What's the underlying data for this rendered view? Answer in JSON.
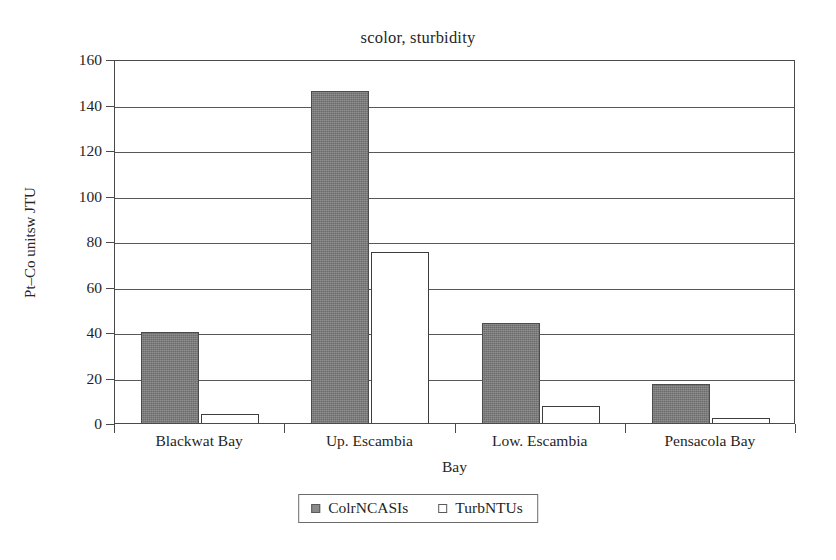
{
  "chart_data": {
    "type": "bar",
    "title": "scolor, sturbidity",
    "xlabel": "Bay",
    "ylabel": "Pt–Co unitsw JTU",
    "categories": [
      "Blackwat Bay",
      "Up. Escambia",
      "Low. Escambia",
      "Pensacola Bay"
    ],
    "series": [
      {
        "name": "ColrNCASIs",
        "values": [
          40,
          146,
          44,
          17
        ],
        "color": "#797979",
        "swatch": "filled-gray-square"
      },
      {
        "name": "TurbNTUs",
        "values": [
          4,
          75,
          7.5,
          2
        ],
        "color": "#ffffff",
        "swatch": "empty-white-square"
      }
    ],
    "ylim": [
      0,
      160
    ],
    "ytick_step": 20,
    "yticks": [
      "160",
      "140",
      "120",
      "100",
      "80",
      "60",
      "40",
      "20",
      "0"
    ],
    "ytick_values": [
      160,
      140,
      120,
      100,
      80,
      60,
      40,
      20,
      0
    ],
    "grid": true,
    "grid_axis": "y",
    "legend_position": "bottom-center"
  }
}
